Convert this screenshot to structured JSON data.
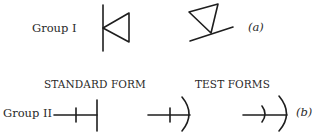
{
  "group1": {
    "label": "Group I",
    "tag": "(a)",
    "symbols": [
      "triangle-with-vertical-line",
      "tilted-triangle-on-line"
    ]
  },
  "group2": {
    "label": "Group II",
    "tag": "(b)",
    "standard_caption": "STANDARD FORM",
    "test_caption": "TEST FORMS",
    "symbols": [
      "line-tick-bar",
      "line-tick-arc",
      "line-arc-arc"
    ]
  },
  "colors": {
    "ink": "#1e1e1e",
    "background": "#ffffff"
  }
}
